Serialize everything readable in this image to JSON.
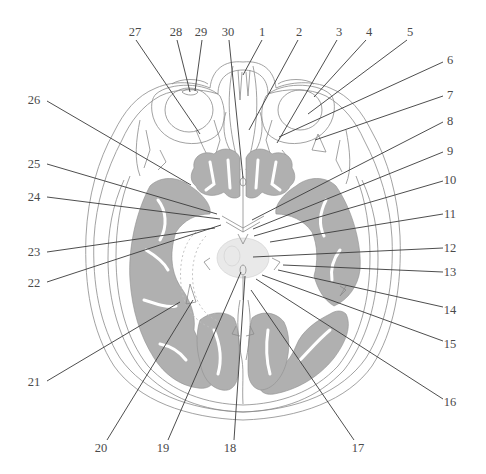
{
  "figure": {
    "type": "anatomical-cross-section",
    "colors": {
      "grey_matter": "#b0b0b0",
      "outline": "#8a8a8a",
      "leader_line": "#3a3a3a",
      "label_text": "#4a4a4a",
      "background": "#ffffff"
    }
  },
  "labels": [
    {
      "id": "1",
      "text": "1",
      "x": 262,
      "y": 36,
      "lx1": 262,
      "ly1": 40,
      "lx2": 243,
      "ly2": 75
    },
    {
      "id": "2",
      "text": "2",
      "x": 299,
      "y": 36,
      "lx1": 298,
      "ly1": 40,
      "lx2": 249,
      "ly2": 130
    },
    {
      "id": "3",
      "text": "3",
      "x": 339,
      "y": 36,
      "lx1": 337,
      "ly1": 40,
      "lx2": 277,
      "ly2": 143
    },
    {
      "id": "4",
      "text": "4",
      "x": 369,
      "y": 36,
      "lx1": 366,
      "ly1": 40,
      "lx2": 314,
      "ly2": 97
    },
    {
      "id": "5",
      "text": "5",
      "x": 410,
      "y": 36,
      "lx1": 407,
      "ly1": 40,
      "lx2": 308,
      "ly2": 114
    },
    {
      "id": "6",
      "text": "6",
      "x": 450,
      "y": 64,
      "lx1": 443,
      "ly1": 62,
      "lx2": 279,
      "ly2": 137
    },
    {
      "id": "7",
      "text": "7",
      "x": 450,
      "y": 99,
      "lx1": 443,
      "ly1": 96,
      "lx2": 315,
      "ly2": 140
    },
    {
      "id": "8",
      "text": "8",
      "x": 450,
      "y": 125,
      "lx1": 443,
      "ly1": 122,
      "lx2": 252,
      "ly2": 220
    },
    {
      "id": "9",
      "text": "9",
      "x": 450,
      "y": 155,
      "lx1": 443,
      "ly1": 152,
      "lx2": 253,
      "ly2": 229
    },
    {
      "id": "10",
      "text": "10",
      "x": 450,
      "y": 184,
      "lx1": 443,
      "ly1": 181,
      "lx2": 254,
      "ly2": 236
    },
    {
      "id": "11",
      "text": "11",
      "x": 450,
      "y": 218,
      "lx1": 443,
      "ly1": 214,
      "lx2": 270,
      "ly2": 242
    },
    {
      "id": "12",
      "text": "12",
      "x": 450,
      "y": 252,
      "lx1": 443,
      "ly1": 248,
      "lx2": 253,
      "ly2": 257
    },
    {
      "id": "13",
      "text": "13",
      "x": 450,
      "y": 276,
      "lx1": 443,
      "ly1": 272,
      "lx2": 283,
      "ly2": 265
    },
    {
      "id": "14",
      "text": "14",
      "x": 450,
      "y": 314,
      "lx1": 443,
      "ly1": 307,
      "lx2": 278,
      "ly2": 270
    },
    {
      "id": "15",
      "text": "15",
      "x": 450,
      "y": 348,
      "lx1": 443,
      "ly1": 341,
      "lx2": 262,
      "ly2": 275
    },
    {
      "id": "16",
      "text": "16",
      "x": 450,
      "y": 406,
      "lx1": 443,
      "ly1": 399,
      "lx2": 256,
      "ly2": 279
    },
    {
      "id": "17",
      "text": "17",
      "x": 358,
      "y": 452,
      "lx1": 354,
      "ly1": 440,
      "lx2": 251,
      "ly2": 290
    },
    {
      "id": "18",
      "text": "18",
      "x": 230,
      "y": 452,
      "lx1": 234,
      "ly1": 440,
      "lx2": 245,
      "ly2": 276
    },
    {
      "id": "19",
      "text": "19",
      "x": 163,
      "y": 452,
      "lx1": 168,
      "ly1": 440,
      "lx2": 241,
      "ly2": 272
    },
    {
      "id": "20",
      "text": "20",
      "x": 101,
      "y": 452,
      "lx1": 107,
      "ly1": 440,
      "lx2": 193,
      "ly2": 300
    },
    {
      "id": "21",
      "text": "21",
      "x": 34,
      "y": 386,
      "lx1": 47,
      "ly1": 381,
      "lx2": 180,
      "ly2": 302
    },
    {
      "id": "22",
      "text": "22",
      "x": 34,
      "y": 287,
      "lx1": 47,
      "ly1": 282,
      "lx2": 221,
      "ly2": 225
    },
    {
      "id": "23",
      "text": "23",
      "x": 34,
      "y": 256,
      "lx1": 47,
      "ly1": 252,
      "lx2": 215,
      "ly2": 228
    },
    {
      "id": "24",
      "text": "24",
      "x": 34,
      "y": 201,
      "lx1": 47,
      "ly1": 197,
      "lx2": 220,
      "ly2": 219
    },
    {
      "id": "25",
      "text": "25",
      "x": 34,
      "y": 168,
      "lx1": 47,
      "ly1": 164,
      "lx2": 217,
      "ly2": 214
    },
    {
      "id": "26",
      "text": "26",
      "x": 34,
      "y": 104,
      "lx1": 47,
      "ly1": 101,
      "lx2": 191,
      "ly2": 185
    },
    {
      "id": "27",
      "text": "27",
      "x": 135,
      "y": 36,
      "lx1": 136,
      "ly1": 40,
      "lx2": 200,
      "ly2": 134
    },
    {
      "id": "28",
      "text": "28",
      "x": 176,
      "y": 36,
      "lx1": 177,
      "ly1": 40,
      "lx2": 190,
      "ly2": 92
    },
    {
      "id": "29",
      "text": "29",
      "x": 201,
      "y": 36,
      "lx1": 202,
      "ly1": 40,
      "lx2": 195,
      "ly2": 91
    },
    {
      "id": "30",
      "text": "30",
      "x": 228,
      "y": 36,
      "lx1": 229,
      "ly1": 40,
      "lx2": 243,
      "ly2": 178
    }
  ]
}
